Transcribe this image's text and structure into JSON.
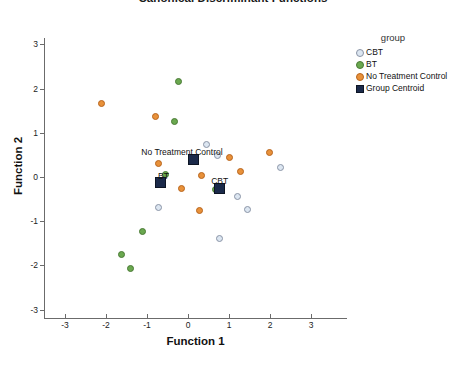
{
  "chart_data": {
    "type": "scatter",
    "title": "Canonical Discriminant Functions",
    "xlabel": "Function 1",
    "ylabel": "Function 2",
    "xlim": [
      -3.5,
      3.5
    ],
    "ylim": [
      -3.5,
      3.5
    ],
    "xticks": [
      -3,
      -2,
      -1,
      0,
      1,
      2,
      3
    ],
    "yticks": [
      -3,
      -2,
      -1,
      0,
      1,
      2,
      3
    ],
    "xtick_labels": [
      "-3",
      "-2",
      "-1",
      "0",
      "1",
      "2",
      "3"
    ],
    "ytick_labels": [
      "-3",
      "-2",
      "-1",
      "0",
      "1",
      "2",
      "3"
    ],
    "grid": false,
    "legend_position": "right",
    "legend_title": "group",
    "series": [
      {
        "name": "CBT",
        "marker": "circle",
        "color": "#dce6f1",
        "edge_color": "#8a94a6",
        "points": [
          [
            0.44,
            0.73
          ],
          [
            0.73,
            0.48
          ],
          [
            2.26,
            0.21
          ],
          [
            1.2,
            -0.44
          ],
          [
            1.44,
            -0.73
          ],
          [
            -0.72,
            -0.68
          ],
          [
            0.78,
            -1.39
          ]
        ]
      },
      {
        "name": "BT",
        "marker": "circle",
        "color": "#6aa84f",
        "edge_color": "#4a7a35",
        "points": [
          [
            -0.22,
            2.15
          ],
          [
            -0.34,
            1.26
          ],
          [
            -0.56,
            0.06
          ],
          [
            0.68,
            -0.28
          ],
          [
            -1.1,
            -1.23
          ],
          [
            -1.61,
            -1.75
          ],
          [
            -1.4,
            -2.07
          ]
        ]
      },
      {
        "name": "No Treatment Control",
        "marker": "circle",
        "color": "#e8913a",
        "edge_color": "#b8651d",
        "points": [
          [
            -2.12,
            1.66
          ],
          [
            -0.8,
            1.38
          ],
          [
            -0.73,
            0.3
          ],
          [
            0.32,
            0.04
          ],
          [
            1.0,
            0.43
          ],
          [
            1.27,
            0.12
          ],
          [
            1.98,
            0.56
          ],
          [
            -0.17,
            -0.25
          ],
          [
            0.27,
            -0.76
          ]
        ]
      },
      {
        "name": "Group Centroid",
        "marker": "square",
        "color": "#1b2a4a",
        "edge_color": "#0d1524",
        "points": [
          [
            0.13,
            0.4
          ],
          [
            -0.68,
            -0.13
          ],
          [
            0.76,
            -0.25
          ]
        ]
      }
    ],
    "annotations": [
      {
        "text": "No Treatment Control",
        "x": 0.13,
        "y": 0.4,
        "label_dx": -52,
        "label_dy": -12
      },
      {
        "text": "BT",
        "x": -0.68,
        "y": -0.13,
        "label_dx": -2,
        "label_dy": -12
      },
      {
        "text": "CBT",
        "x": 0.76,
        "y": -0.25,
        "label_dx": -8,
        "label_dy": -12
      }
    ]
  },
  "legend": {
    "title": "group",
    "entries": [
      {
        "label": "CBT",
        "swatch": "circle-cbt"
      },
      {
        "label": "BT",
        "swatch": "circle-bt"
      },
      {
        "label": "No Treatment Control",
        "swatch": "circle-ntc"
      },
      {
        "label": "Group Centroid",
        "swatch": "square-centroid"
      }
    ]
  }
}
